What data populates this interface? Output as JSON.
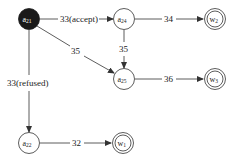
{
  "diagram": {
    "type": "state-transition-graph",
    "colors": {
      "stroke": "#333333",
      "start_fill": "#1a1a1a",
      "start_text": "#ffffff",
      "node_fill": "#ffffff",
      "text": "#222222"
    },
    "nodes": [
      {
        "id": "a21",
        "label": "a",
        "sub": "21",
        "x": 29,
        "y": 19,
        "kind": "start"
      },
      {
        "id": "a24",
        "label": "a",
        "sub": "24",
        "x": 124,
        "y": 19,
        "kind": "state"
      },
      {
        "id": "w2",
        "label": "w",
        "sub": "2",
        "x": 215,
        "y": 19,
        "kind": "final"
      },
      {
        "id": "a25",
        "label": "a",
        "sub": "25",
        "x": 124,
        "y": 79,
        "kind": "state"
      },
      {
        "id": "w3",
        "label": "w",
        "sub": "3",
        "x": 215,
        "y": 79,
        "kind": "final"
      },
      {
        "id": "a22",
        "label": "a",
        "sub": "22",
        "x": 29,
        "y": 143,
        "kind": "state"
      },
      {
        "id": "w1",
        "label": "w",
        "sub": "1",
        "x": 123,
        "y": 143,
        "kind": "final"
      }
    ],
    "edges": [
      {
        "from": "a21",
        "to": "a24",
        "label": "33(accept)"
      },
      {
        "from": "a21",
        "to": "a25",
        "label": "35"
      },
      {
        "from": "a21",
        "to": "a22",
        "label": "33(refused)"
      },
      {
        "from": "a24",
        "to": "w2",
        "label": "34"
      },
      {
        "from": "a24",
        "to": "a25",
        "label": "35"
      },
      {
        "from": "a25",
        "to": "w3",
        "label": "36"
      },
      {
        "from": "a22",
        "to": "w1",
        "label": "32"
      }
    ]
  }
}
